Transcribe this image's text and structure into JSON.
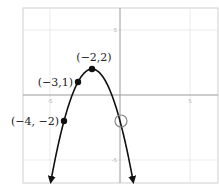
{
  "chart_data": {
    "type": "line",
    "title": "",
    "xlabel": "",
    "ylabel": "",
    "xlim": [
      -7,
      7
    ],
    "ylim": [
      -7,
      7
    ],
    "grid": true,
    "x_ticks": [
      {
        "value": -5,
        "label": "-5"
      },
      {
        "value": 5,
        "label": "5"
      }
    ],
    "y_ticks": [
      {
        "value": 5,
        "label": "5"
      },
      {
        "value": -5,
        "label": "-5"
      }
    ],
    "series": [
      {
        "name": "parabola",
        "description": "Downward-opening parabola with vertex at (-2,2), arrows at both ends",
        "equation": "y = -(x+2)^2 + 2",
        "domain_drawn": [
          -5,
          1
        ]
      }
    ],
    "points": [
      {
        "x": -2,
        "y": 2,
        "label": "(−2,2)",
        "style": "filled"
      },
      {
        "x": -3,
        "y": 1,
        "label": "(−3,1)",
        "style": "filled"
      },
      {
        "x": -4,
        "y": -2,
        "label": "(−4, −2)",
        "style": "filled"
      },
      {
        "x": 0,
        "y": -2,
        "label": "",
        "style": "open"
      }
    ]
  }
}
